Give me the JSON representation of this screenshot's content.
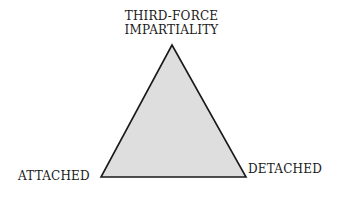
{
  "diagram": {
    "type": "triangle",
    "vertices": {
      "top": {
        "line1": "THIRD-FORCE",
        "line2": "IMPARTIALITY"
      },
      "left": "ATTACHED",
      "right": "DETACHED"
    },
    "fill_color": "#dedede",
    "stroke_color": "#1a1a1a"
  }
}
